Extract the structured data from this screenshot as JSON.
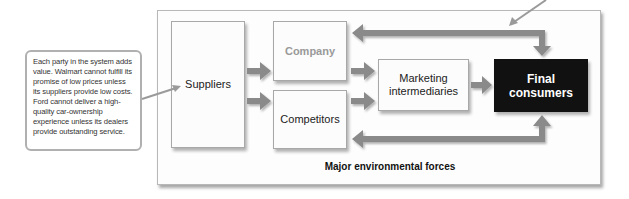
{
  "callout": {
    "text": "Each party in the system adds value. Walmart cannot fulfill its promise of low prices unless its suppliers provide low costs. Ford cannot deliver a high-quality car-ownership experience unless its dealers provide outstanding service."
  },
  "diagram": {
    "nodes": {
      "suppliers": "Suppliers",
      "company": "Company",
      "competitors": "Competitors",
      "intermediaries": "Marketing intermediaries",
      "consumers": "Final consumers"
    },
    "environment_label": "Major environmental forces",
    "colors": {
      "arrow": "#8a8a8a",
      "consumers_bg": "#111111",
      "company_text": "#999999",
      "frame_border": "#b8b8b8"
    },
    "flows": [
      {
        "from": "Suppliers",
        "to": "Company"
      },
      {
        "from": "Suppliers",
        "to": "Competitors"
      },
      {
        "from": "Company",
        "to": "Marketing intermediaries"
      },
      {
        "from": "Competitors",
        "to": "Marketing intermediaries"
      },
      {
        "from": "Marketing intermediaries",
        "to": "Final consumers"
      },
      {
        "from": "Company",
        "to": "Final consumers",
        "bidirectional": true
      },
      {
        "from": "Competitors",
        "to": "Final consumers",
        "bidirectional": true
      }
    ]
  }
}
